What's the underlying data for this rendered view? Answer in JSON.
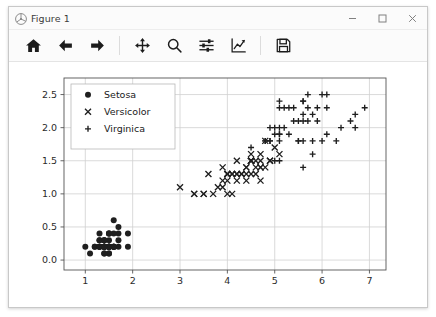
{
  "window": {
    "title": "Figure 1",
    "icon": "matplotlib-icon",
    "buttons": [
      {
        "name": "minimize-button",
        "glyph": "minimize-icon"
      },
      {
        "name": "maximize-button",
        "glyph": "maximize-icon"
      },
      {
        "name": "close-button",
        "glyph": "close-icon"
      }
    ]
  },
  "toolbar": {
    "items": [
      {
        "name": "home-button",
        "icon": "home-icon",
        "tooltip": "Reset original view"
      },
      {
        "name": "back-button",
        "icon": "arrow-left-icon",
        "tooltip": "Back to previous view"
      },
      {
        "name": "forward-button",
        "icon": "arrow-right-icon",
        "tooltip": "Forward to next view"
      },
      {
        "name": "pan-button",
        "icon": "move-cross-icon",
        "tooltip": "Pan axes with left mouse, zoom with right"
      },
      {
        "name": "zoom-button",
        "icon": "magnifier-icon",
        "tooltip": "Zoom to rectangle"
      },
      {
        "name": "subplots-button",
        "icon": "sliders-icon",
        "tooltip": "Configure subplots"
      },
      {
        "name": "customize-button",
        "icon": "axes-curve-icon",
        "tooltip": "Edit axis, curve and image parameters"
      },
      {
        "name": "save-button",
        "icon": "floppy-disk-icon",
        "tooltip": "Save the figure"
      }
    ],
    "separators_after": [
      2,
      6
    ]
  },
  "chart_data": {
    "type": "scatter",
    "title": "",
    "xlabel": "",
    "ylabel": "",
    "xlim": [
      0.55,
      7.35
    ],
    "ylim": [
      -0.15,
      2.75
    ],
    "xticks": [
      1,
      2,
      3,
      4,
      5,
      6,
      7
    ],
    "yticks": [
      0.0,
      0.5,
      1.0,
      1.5,
      2.0,
      2.5
    ],
    "xticklabels": [
      "1",
      "2",
      "3",
      "4",
      "5",
      "6",
      "7"
    ],
    "yticklabels": [
      "0.0",
      "0.5",
      "1.0",
      "1.5",
      "2.0",
      "2.5"
    ],
    "grid": true,
    "grid_color": "#d0d0d0",
    "legend_position": "upper left",
    "marker_color": "#1f1f1f",
    "series": [
      {
        "name": "Setosa",
        "marker": "circle",
        "color": "#1f1f1f",
        "points": [
          [
            1.4,
            0.2
          ],
          [
            1.4,
            0.2
          ],
          [
            1.3,
            0.2
          ],
          [
            1.5,
            0.2
          ],
          [
            1.4,
            0.2
          ],
          [
            1.7,
            0.4
          ],
          [
            1.4,
            0.3
          ],
          [
            1.5,
            0.2
          ],
          [
            1.4,
            0.2
          ],
          [
            1.5,
            0.1
          ],
          [
            1.5,
            0.2
          ],
          [
            1.6,
            0.2
          ],
          [
            1.4,
            0.1
          ],
          [
            1.1,
            0.1
          ],
          [
            1.2,
            0.2
          ],
          [
            1.5,
            0.4
          ],
          [
            1.3,
            0.4
          ],
          [
            1.4,
            0.3
          ],
          [
            1.7,
            0.3
          ],
          [
            1.5,
            0.3
          ],
          [
            1.7,
            0.2
          ],
          [
            1.5,
            0.4
          ],
          [
            1.0,
            0.2
          ],
          [
            1.7,
            0.5
          ],
          [
            1.9,
            0.2
          ],
          [
            1.6,
            0.2
          ],
          [
            1.6,
            0.4
          ],
          [
            1.5,
            0.2
          ],
          [
            1.4,
            0.2
          ],
          [
            1.6,
            0.2
          ],
          [
            1.6,
            0.2
          ],
          [
            1.5,
            0.4
          ],
          [
            1.5,
            0.1
          ],
          [
            1.4,
            0.2
          ],
          [
            1.5,
            0.2
          ],
          [
            1.2,
            0.2
          ],
          [
            1.3,
            0.2
          ],
          [
            1.4,
            0.1
          ],
          [
            1.3,
            0.2
          ],
          [
            1.5,
            0.2
          ],
          [
            1.3,
            0.3
          ],
          [
            1.3,
            0.3
          ],
          [
            1.3,
            0.2
          ],
          [
            1.6,
            0.6
          ],
          [
            1.9,
            0.4
          ],
          [
            1.4,
            0.3
          ],
          [
            1.6,
            0.2
          ],
          [
            1.4,
            0.2
          ],
          [
            1.5,
            0.2
          ],
          [
            1.4,
            0.2
          ]
        ]
      },
      {
        "name": "Versicolor",
        "marker": "x",
        "color": "#1f1f1f",
        "points": [
          [
            4.7,
            1.4
          ],
          [
            4.5,
            1.5
          ],
          [
            4.9,
            1.5
          ],
          [
            4.0,
            1.3
          ],
          [
            4.6,
            1.5
          ],
          [
            4.5,
            1.3
          ],
          [
            4.7,
            1.6
          ],
          [
            3.3,
            1.0
          ],
          [
            4.6,
            1.3
          ],
          [
            3.9,
            1.4
          ],
          [
            3.5,
            1.0
          ],
          [
            4.2,
            1.5
          ],
          [
            4.0,
            1.0
          ],
          [
            4.7,
            1.4
          ],
          [
            3.6,
            1.3
          ],
          [
            4.4,
            1.4
          ],
          [
            4.5,
            1.5
          ],
          [
            4.1,
            1.0
          ],
          [
            4.5,
            1.5
          ],
          [
            3.9,
            1.1
          ],
          [
            4.8,
            1.8
          ],
          [
            4.0,
            1.3
          ],
          [
            4.9,
            1.5
          ],
          [
            4.7,
            1.2
          ],
          [
            4.3,
            1.3
          ],
          [
            4.4,
            1.4
          ],
          [
            4.8,
            1.4
          ],
          [
            5.0,
            1.7
          ],
          [
            4.5,
            1.5
          ],
          [
            3.5,
            1.0
          ],
          [
            3.8,
            1.1
          ],
          [
            3.7,
            1.0
          ],
          [
            3.9,
            1.2
          ],
          [
            5.1,
            1.6
          ],
          [
            4.5,
            1.5
          ],
          [
            4.5,
            1.6
          ],
          [
            4.7,
            1.5
          ],
          [
            4.4,
            1.3
          ],
          [
            4.1,
            1.3
          ],
          [
            4.0,
            1.3
          ],
          [
            4.4,
            1.2
          ],
          [
            4.6,
            1.4
          ],
          [
            4.0,
            1.2
          ],
          [
            3.3,
            1.0
          ],
          [
            4.2,
            1.3
          ],
          [
            4.2,
            1.2
          ],
          [
            4.2,
            1.3
          ],
          [
            4.3,
            1.3
          ],
          [
            3.0,
            1.1
          ],
          [
            4.1,
            1.3
          ]
        ]
      },
      {
        "name": "Virginica",
        "marker": "plus",
        "color": "#1f1f1f",
        "points": [
          [
            6.0,
            2.5
          ],
          [
            5.1,
            1.9
          ],
          [
            5.9,
            2.1
          ],
          [
            5.6,
            1.8
          ],
          [
            5.8,
            2.2
          ],
          [
            6.6,
            2.1
          ],
          [
            4.5,
            1.7
          ],
          [
            6.3,
            1.8
          ],
          [
            5.8,
            1.8
          ],
          [
            6.1,
            2.5
          ],
          [
            5.1,
            2.0
          ],
          [
            5.3,
            1.9
          ],
          [
            5.5,
            2.1
          ],
          [
            5.0,
            2.0
          ],
          [
            5.1,
            2.4
          ],
          [
            5.3,
            2.3
          ],
          [
            5.5,
            1.8
          ],
          [
            6.7,
            2.2
          ],
          [
            6.9,
            2.3
          ],
          [
            5.0,
            1.5
          ],
          [
            5.7,
            2.3
          ],
          [
            4.9,
            2.0
          ],
          [
            6.7,
            2.0
          ],
          [
            4.9,
            1.8
          ],
          [
            5.7,
            2.1
          ],
          [
            6.0,
            1.8
          ],
          [
            4.8,
            1.8
          ],
          [
            4.9,
            1.8
          ],
          [
            5.6,
            2.1
          ],
          [
            5.8,
            1.6
          ],
          [
            6.1,
            1.9
          ],
          [
            6.4,
            2.0
          ],
          [
            5.6,
            2.2
          ],
          [
            5.1,
            1.5
          ],
          [
            5.6,
            1.4
          ],
          [
            6.1,
            2.3
          ],
          [
            5.6,
            2.4
          ],
          [
            5.5,
            1.8
          ],
          [
            4.8,
            1.8
          ],
          [
            5.4,
            2.1
          ],
          [
            5.6,
            2.4
          ],
          [
            5.1,
            2.3
          ],
          [
            5.1,
            1.9
          ],
          [
            5.9,
            2.3
          ],
          [
            5.7,
            2.5
          ],
          [
            5.2,
            2.3
          ],
          [
            5.0,
            1.9
          ],
          [
            5.2,
            2.0
          ],
          [
            5.4,
            2.3
          ],
          [
            5.1,
            1.8
          ]
        ]
      }
    ]
  }
}
